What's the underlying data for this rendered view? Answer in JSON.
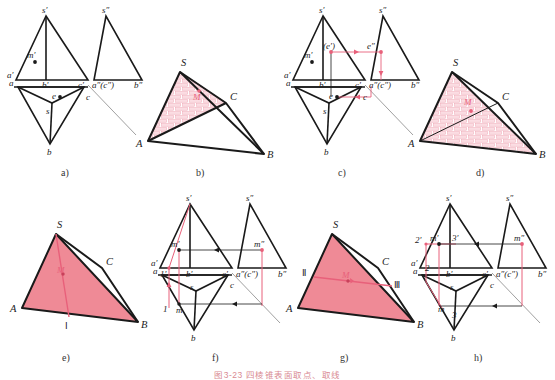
{
  "figure": {
    "caption": "图3-23   四棱锥表面取点、取线",
    "width": 555,
    "height": 378,
    "colors": {
      "outline": "#1a1a1a",
      "thin_line": "#555555",
      "pink": "#e8607a",
      "pink_fill": "#ef8a96",
      "hatch": "#f0a6b4",
      "background": "#ffffff",
      "label": "#222222"
    }
  },
  "panels": [
    {
      "id": "a",
      "letter": "a)",
      "type": "orthographic-projection",
      "description": "Front view, side view and top view of pyramid with point M on face",
      "labels": [
        "s'",
        "s\"",
        "m'",
        "a'",
        "b'",
        "c'",
        "a\"(c\")",
        "b\"",
        "a",
        "e",
        "c",
        "s",
        "b"
      ]
    },
    {
      "id": "b",
      "letter": "b)",
      "type": "pictorial-3d",
      "description": "3D pyramid with brick-hatched triangular region S-A-C and point M",
      "labels": [
        "S",
        "A",
        "B",
        "C",
        "M"
      ]
    },
    {
      "id": "c",
      "letter": "c)",
      "type": "orthographic-projection",
      "description": "Projection with pink construction arrows locating point E",
      "labels": [
        "s'",
        "s\"",
        "m'",
        "(e')",
        "e\"",
        "a'",
        "b'",
        "c'",
        "a\"(c\")",
        "b\"",
        "a",
        "e",
        "c",
        "s",
        "b"
      ]
    },
    {
      "id": "d",
      "letter": "d)",
      "type": "pictorial-3d",
      "description": "3D pyramid with whole front face S-A-B brick hatched, line A-C and point M",
      "labels": [
        "S",
        "A",
        "B",
        "C",
        "M"
      ]
    },
    {
      "id": "e",
      "letter": "e)",
      "type": "pictorial-3d",
      "description": "3D pyramid with solid pink face and line from S to point I through M",
      "labels": [
        "S",
        "A",
        "B",
        "C",
        "M",
        "I"
      ]
    },
    {
      "id": "f",
      "letter": "f)",
      "type": "orthographic-projection",
      "description": "Projection with pink auxiliary line s'-1' through m' and transfer arrows",
      "labels": [
        "s'",
        "s\"",
        "m'",
        "m\"",
        "a'",
        "1'",
        "b'",
        "c'",
        "a\"(c\")",
        "b\"",
        "a",
        "s",
        "c",
        "1",
        "m",
        "b"
      ]
    },
    {
      "id": "g",
      "letter": "g)",
      "type": "pictorial-3d",
      "description": "3D pyramid with solid pink face and horizontal line II-III through M",
      "labels": [
        "S",
        "A",
        "B",
        "C",
        "M",
        "II",
        "III"
      ]
    },
    {
      "id": "h",
      "letter": "h)",
      "type": "orthographic-projection",
      "description": "Projection with pink horizontal auxiliary line 2'-3' through m' and transfer arrows",
      "labels": [
        "s'",
        "s\"",
        "2'",
        "m'",
        "3'",
        "m\"",
        "a'",
        "b'",
        "c'",
        "a\"(c\")",
        "b\"",
        "2",
        "a",
        "s",
        "c",
        "m",
        "3",
        "b"
      ]
    }
  ]
}
